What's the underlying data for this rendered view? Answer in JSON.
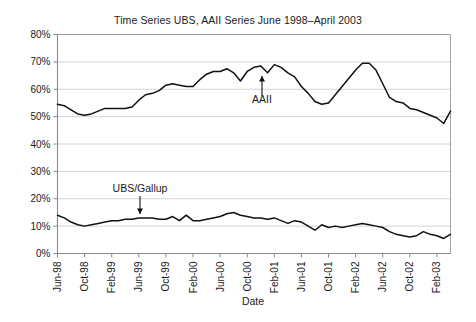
{
  "chart_data": {
    "type": "line",
    "title": "Time Series UBS, AAII Series June 1998–April 2003",
    "xlabel": "Date",
    "ylabel": "",
    "ylim": [
      0,
      80
    ],
    "ytick_labels": [
      "0%",
      "10%",
      "20%",
      "30%",
      "40%",
      "50%",
      "60%",
      "70%",
      "80%"
    ],
    "ytick_values": [
      0,
      10,
      20,
      30,
      40,
      50,
      60,
      70,
      80
    ],
    "grid": true,
    "legend_position": "inline-annotations",
    "xtick_labels": [
      "Jun-98",
      "Oct-98",
      "Feb-99",
      "Jun-99",
      "Oct-99",
      "Feb-00",
      "Jun-00",
      "Oct-00",
      "Feb-01",
      "Jun-01",
      "Oct-01",
      "Feb-02",
      "Jun-02",
      "Oct-02",
      "Feb-03"
    ],
    "x": [
      "Jun-98",
      "Jul-98",
      "Aug-98",
      "Sep-98",
      "Oct-98",
      "Nov-98",
      "Dec-98",
      "Jan-99",
      "Feb-99",
      "Mar-99",
      "Apr-99",
      "May-99",
      "Jun-99",
      "Jul-99",
      "Aug-99",
      "Sep-99",
      "Oct-99",
      "Nov-99",
      "Dec-99",
      "Jan-00",
      "Feb-00",
      "Mar-00",
      "Apr-00",
      "May-00",
      "Jun-00",
      "Jul-00",
      "Aug-00",
      "Sep-00",
      "Oct-00",
      "Nov-00",
      "Dec-00",
      "Jan-01",
      "Feb-01",
      "Mar-01",
      "Apr-01",
      "May-01",
      "Jun-01",
      "Jul-01",
      "Aug-01",
      "Sep-01",
      "Oct-01",
      "Nov-01",
      "Dec-01",
      "Jan-02",
      "Feb-02",
      "Mar-02",
      "Apr-02",
      "May-02",
      "Jun-02",
      "Jul-02",
      "Aug-02",
      "Sep-02",
      "Oct-02",
      "Nov-02",
      "Dec-02",
      "Jan-03",
      "Feb-03",
      "Mar-03",
      "Apr-03"
    ],
    "series": [
      {
        "name": "AAII",
        "annotation": "AAII",
        "values": [
          54.5,
          54.0,
          52.5,
          51.0,
          50.5,
          51.0,
          52.0,
          53.0,
          53.0,
          53.0,
          53.0,
          53.5,
          56.0,
          58.0,
          58.5,
          59.5,
          61.5,
          62.0,
          61.5,
          61.0,
          61.0,
          63.5,
          65.5,
          66.5,
          66.5,
          67.5,
          66.0,
          63.0,
          66.5,
          68.0,
          68.5,
          66.0,
          69.0,
          68.0,
          66.0,
          64.5,
          61.0,
          58.5,
          55.5,
          54.5,
          55.0,
          58.0,
          61.0,
          64.0,
          67.0,
          69.5,
          69.5,
          67.0,
          62.0,
          57.0,
          55.5,
          55.0,
          53.0,
          52.5,
          51.5,
          50.5,
          49.5,
          47.5,
          52.0
        ]
      },
      {
        "name": "UBS/Gallup",
        "annotation": "UBS/Gallup",
        "values": [
          14.0,
          13.0,
          11.5,
          10.5,
          10.0,
          10.5,
          11.0,
          11.5,
          12.0,
          12.0,
          12.5,
          12.5,
          13.0,
          13.0,
          13.0,
          12.5,
          12.5,
          13.5,
          12.0,
          14.0,
          12.0,
          12.0,
          12.5,
          13.0,
          13.5,
          14.5,
          15.0,
          14.0,
          13.5,
          13.0,
          13.0,
          12.5,
          13.0,
          12.0,
          11.0,
          12.0,
          11.5,
          10.0,
          8.5,
          10.5,
          9.5,
          10.0,
          9.5,
          10.0,
          10.5,
          11.0,
          10.5,
          10.0,
          9.5,
          8.0,
          7.0,
          6.5,
          6.0,
          6.5,
          8.0,
          7.0,
          6.5,
          5.5,
          7.0
        ]
      }
    ]
  },
  "annotations": {
    "aaii_label": "AAII",
    "ubs_label": "UBS/Gallup"
  },
  "colors": {
    "line": "#111111",
    "grid": "#c9c9c9",
    "axis": "#8a8a8a",
    "background": "#ffffff"
  }
}
